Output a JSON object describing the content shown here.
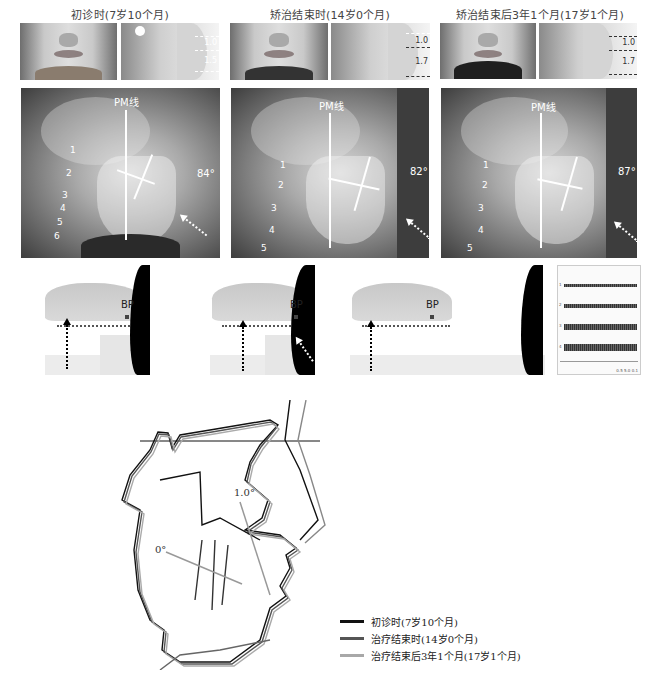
{
  "figure": {
    "columns": [
      {
        "title": "初诊时(7岁10个月)",
        "photo_measurements": [
          "1.0",
          "1.5"
        ],
        "xray": {
          "pm_label": "PM线",
          "angle": "84°",
          "vertebrae": [
            "1",
            "2",
            "3",
            "4",
            "5",
            "6"
          ]
        },
        "occlusion": {
          "bp_label": "BP"
        }
      },
      {
        "title": "矫治结束时(14岁0个月)",
        "photo_measurements": [
          "1.0",
          "1.7"
        ],
        "xray": {
          "pm_label": "PM线",
          "angle": "82°",
          "vertebrae": [
            "1",
            "2",
            "3",
            "4",
            "5"
          ]
        },
        "occlusion": {
          "bp_label": "BP"
        }
      },
      {
        "title": "矫治结束后3年1个月(17岁1个月)",
        "photo_measurements": [
          "1.0",
          "1.7"
        ],
        "xray": {
          "pm_label": "PM线",
          "angle": "87°",
          "vertebrae": [
            "1",
            "2",
            "3",
            "4",
            "5"
          ]
        },
        "occlusion": {
          "bp_label": "BP"
        }
      }
    ],
    "emg_panel": {
      "channels": [
        "1",
        "2",
        "3",
        "4"
      ],
      "footer": [
        "0.5",
        "5.0",
        "0.1"
      ]
    },
    "tracing": {
      "angle_labels": [
        "1.0°",
        "0°"
      ]
    },
    "legend": [
      {
        "label": "初诊时(7岁10个月)",
        "color": "#111111"
      },
      {
        "label": "治疗结束时(14岁0个月)",
        "color": "#555555"
      },
      {
        "label": "治疗结束后3年1个月(17岁1个月)",
        "color": "#a8a8a8"
      }
    ]
  }
}
